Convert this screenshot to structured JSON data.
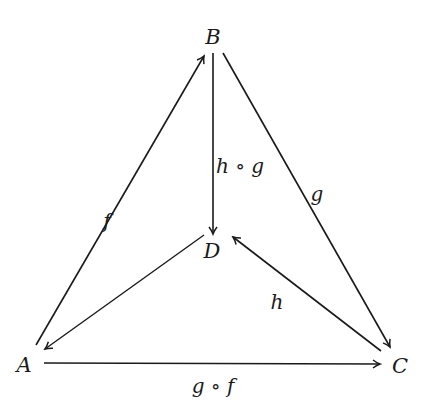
{
  "diagram": {
    "type": "commutative-diagram",
    "colors": {
      "stroke": "#1a1a1a",
      "background": "#ffffff"
    },
    "objects": [
      {
        "id": "A",
        "label": "A",
        "x": 24,
        "y": 365
      },
      {
        "id": "B",
        "label": "B",
        "x": 213,
        "y": 37
      },
      {
        "id": "C",
        "label": "C",
        "x": 400,
        "y": 366
      },
      {
        "id": "D",
        "label": "D",
        "x": 212,
        "y": 251
      }
    ],
    "morphisms": [
      {
        "from": "A",
        "to": "B",
        "label": "f",
        "lx": 107,
        "ly": 221
      },
      {
        "from": "B",
        "to": "D",
        "label": "h ∘ g",
        "lx": 240,
        "ly": 166
      },
      {
        "from": "B",
        "to": "C",
        "label": "g",
        "lx": 317,
        "ly": 194
      },
      {
        "from": "C",
        "to": "D",
        "label": "h",
        "lx": 277,
        "ly": 302
      },
      {
        "from": "D",
        "to": "A",
        "label": "",
        "lx": 0,
        "ly": 0
      },
      {
        "from": "A",
        "to": "C",
        "label": "g ∘ f",
        "lx": 213,
        "ly": 386
      }
    ]
  }
}
